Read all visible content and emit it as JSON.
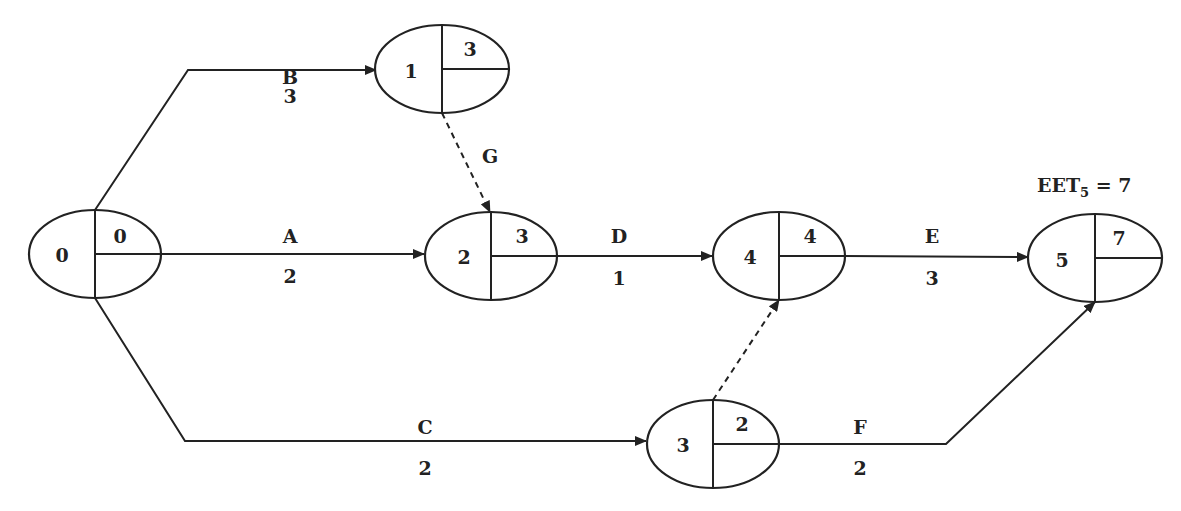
{
  "diagram": {
    "type": "activity-on-arrow network",
    "annotation": {
      "text_main": "EET",
      "text_sub": "5",
      "text_tail": " = 7"
    },
    "nodes": [
      {
        "id": "0",
        "eet": "0",
        "cx": 95,
        "cy": 254
      },
      {
        "id": "1",
        "eet": "3",
        "cx": 442,
        "cy": 69
      },
      {
        "id": "2",
        "eet": "3",
        "cx": 491,
        "cy": 256
      },
      {
        "id": "4",
        "eet": "4",
        "cx": 779,
        "cy": 256
      },
      {
        "id": "5",
        "eet": "7",
        "cx": 1095,
        "cy": 258
      },
      {
        "id": "3",
        "eet": "2",
        "cx": 713,
        "cy": 444
      }
    ],
    "activities": [
      {
        "name": "B",
        "duration": "3",
        "from": "0",
        "to": "1",
        "dummy": false
      },
      {
        "name": "A",
        "duration": "2",
        "from": "0",
        "to": "2",
        "dummy": false
      },
      {
        "name": "C",
        "duration": "2",
        "from": "0",
        "to": "3",
        "dummy": false
      },
      {
        "name": "G",
        "duration": "",
        "from": "1",
        "to": "2",
        "dummy": true
      },
      {
        "name": "D",
        "duration": "1",
        "from": "2",
        "to": "4",
        "dummy": false
      },
      {
        "name": "",
        "duration": "",
        "from": "3",
        "to": "4",
        "dummy": true
      },
      {
        "name": "E",
        "duration": "3",
        "from": "4",
        "to": "5",
        "dummy": false
      },
      {
        "name": "F",
        "duration": "2",
        "from": "3",
        "to": "5",
        "dummy": false
      }
    ]
  }
}
